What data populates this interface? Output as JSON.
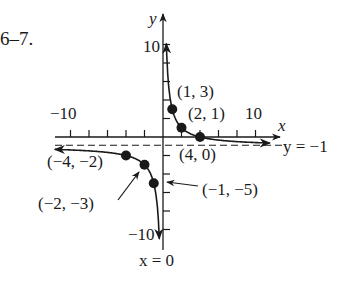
{
  "problem_number": "6–7.",
  "chart_data": {
    "type": "line",
    "title": "",
    "function_note": "hyperbola with asymptotes x = 0 and y = -1",
    "xlabel": "x",
    "ylabel": "y",
    "xlim": [
      -11.5,
      12.5
    ],
    "ylim": [
      -12,
      13
    ],
    "x_tick_step": 2,
    "y_tick_step": 2,
    "x_tick_labels": [
      {
        "value": -10,
        "text": "−10"
      },
      {
        "value": 10,
        "text": "10"
      }
    ],
    "y_tick_labels": [
      {
        "value": 10,
        "text": "10"
      },
      {
        "value": -10,
        "text": "−10"
      }
    ],
    "grid": false,
    "asymptotes": [
      {
        "type": "horizontal",
        "value": -1,
        "label": "y = −1"
      },
      {
        "type": "vertical",
        "value": 0,
        "label": "x = 0"
      }
    ],
    "series": [
      {
        "name": "right branch",
        "x": [
          0.35,
          0.5,
          1,
          2,
          4,
          8,
          12
        ],
        "y": [
          10.4,
          7,
          3,
          1,
          0,
          -0.5,
          -0.67
        ]
      },
      {
        "name": "left branch",
        "x": [
          -11.7,
          -8,
          -4,
          -2,
          -1,
          -0.5,
          -0.36
        ],
        "y": [
          -1.34,
          -1.5,
          -2,
          -3,
          -5,
          -9,
          -12.1
        ]
      }
    ],
    "points": [
      {
        "x": 1,
        "y": 3,
        "label": "(1, 3)"
      },
      {
        "x": 2,
        "y": 1,
        "label": "(2, 1)"
      },
      {
        "x": 4,
        "y": 0,
        "label": "(4, 0)"
      },
      {
        "x": -4,
        "y": -2,
        "label": "(−4, −2)"
      },
      {
        "x": -2,
        "y": -3,
        "label": "(−2, −3)"
      },
      {
        "x": -1,
        "y": -5,
        "label": "(−1, −5)"
      }
    ]
  }
}
